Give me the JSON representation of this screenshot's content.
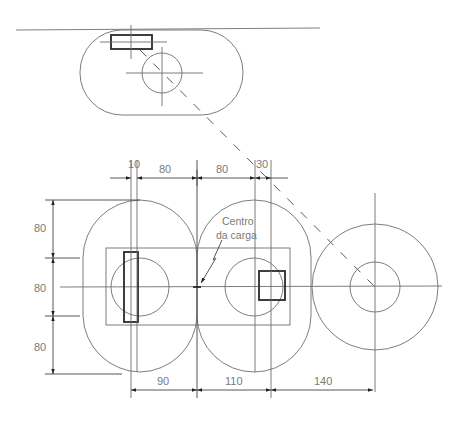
{
  "diagram": {
    "annotation": {
      "line1": "Centro",
      "line2": "da carga"
    },
    "top_dimensions": {
      "d1": "10",
      "d2": "80",
      "d3": "80",
      "d4": "30"
    },
    "left_dimensions": {
      "d1": "80",
      "d2": "80",
      "d3": "80"
    },
    "bottom_dimensions": {
      "d1": "90",
      "d2": "110",
      "d3": "140"
    },
    "colors": {
      "line": "#6e6e6e",
      "bold_line": "#2a2a2a",
      "label": "#7a7a7a",
      "background": "#ffffff"
    }
  }
}
